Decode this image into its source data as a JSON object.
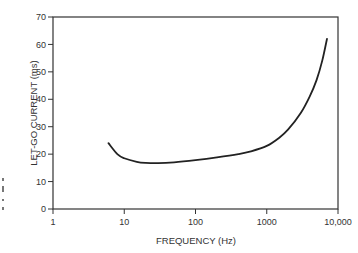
{
  "chart_data": {
    "type": "line",
    "title": "",
    "xlabel": "FREQUENCY (Hz)",
    "ylabel": "LET-GO CURRENT (ms)",
    "xscale": "log",
    "xlim": [
      1,
      10000
    ],
    "ylim": [
      0,
      70
    ],
    "x_ticks": [
      1,
      10,
      100,
      1000,
      10000
    ],
    "x_tick_labels": [
      "1",
      "10",
      "100",
      "1000",
      "10,000"
    ],
    "y_ticks": [
      0,
      10,
      20,
      30,
      40,
      50,
      60,
      70
    ],
    "y_tick_labels": [
      "0",
      "10",
      "20",
      "30",
      "40",
      "50",
      "60",
      "70"
    ],
    "grid": false,
    "legend": null,
    "series": [
      {
        "name": "Let-go current",
        "x": [
          6,
          8,
          10,
          15,
          20,
          30,
          50,
          100,
          200,
          400,
          600,
          1000,
          1500,
          2000,
          3000,
          4000,
          5000,
          6000,
          7000
        ],
        "values": [
          24,
          20,
          18.5,
          17.2,
          16.8,
          16.7,
          17,
          17.8,
          18.8,
          20,
          21,
          23,
          26,
          29,
          35,
          41,
          47,
          54,
          62
        ]
      }
    ]
  }
}
